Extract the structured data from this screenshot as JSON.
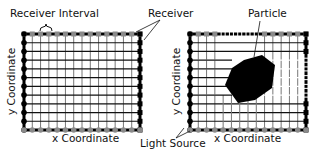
{
  "labels": {
    "receiver_interval": "Receiver Interval",
    "receiver": "Receiver",
    "particle": "Particle",
    "light_source": "Light Source",
    "y_axis_left": "y Coordinate",
    "x_axis_left": "x Coordinate",
    "y_axis_right": "y Coordinate",
    "x_axis_right": "x Coordinate"
  },
  "colors": {
    "light_source": "#000000",
    "receiver_active": "#8a8a8a",
    "receiver_blocked": "#000000",
    "grid_line_dark": "#111111",
    "grid_line_light": "#777777",
    "particle": "#000000"
  },
  "panels": [
    {
      "name": "empty-grid",
      "columns": 14,
      "rows": 11
    },
    {
      "name": "grid-with-particle",
      "columns": 14,
      "rows": 11,
      "shadowed_top_receivers": [
        4,
        5,
        6,
        7,
        8
      ],
      "shadowed_right_receivers": [
        3,
        4,
        5,
        6,
        7
      ]
    }
  ]
}
